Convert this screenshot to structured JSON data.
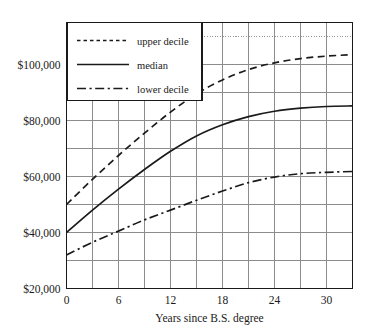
{
  "chart_data": {
    "type": "line",
    "title": "",
    "subtitle": "",
    "xlabel": "Years since B.S. degree",
    "ylabel": "",
    "xlim": [
      0,
      33
    ],
    "ylim": [
      20000,
      115000
    ],
    "grid": true,
    "grid_x_step": 3,
    "grid_y_step": 10000,
    "legend_position": "top-left",
    "x_ticks": [
      0,
      6,
      12,
      18,
      24,
      30
    ],
    "x_tick_labels": [
      "0",
      "6",
      "12",
      "18",
      "24",
      "30"
    ],
    "y_ticks": [
      20000,
      40000,
      60000,
      80000,
      100000
    ],
    "y_tick_labels": [
      "$20,000",
      "$40,000",
      "$60,000",
      "$80,000",
      "$100,000"
    ],
    "x": [
      0,
      3,
      6,
      9,
      12,
      15,
      18,
      21,
      24,
      27,
      30,
      33
    ],
    "series": [
      {
        "name": "upper decile",
        "style": "dashed",
        "color": "#1a1a1a",
        "values": [
          50000,
          59000,
          67500,
          75500,
          83000,
          89500,
          94500,
          98200,
          100600,
          102100,
          103000,
          103500
        ]
      },
      {
        "name": "median",
        "style": "solid",
        "color": "#1a1a1a",
        "values": [
          40000,
          48000,
          55500,
          62500,
          69000,
          74500,
          78500,
          81400,
          83300,
          84400,
          85000,
          85200
        ]
      },
      {
        "name": "lower decile",
        "style": "dash-dot",
        "color": "#1a1a1a",
        "values": [
          32000,
          36500,
          40500,
          44500,
          48000,
          51500,
          54800,
          57800,
          59800,
          61000,
          61500,
          61800
        ]
      }
    ],
    "annotations": [
      {
        "name": "top-dotted-gridline",
        "type": "hline",
        "y": 110000,
        "style": "dotted"
      }
    ]
  },
  "legend": {
    "items": [
      {
        "label": "upper decile",
        "key": "legend-item-upper-decile"
      },
      {
        "label": "median",
        "key": "legend-item-median"
      },
      {
        "label": "lower decile",
        "key": "legend-item-lower-decile"
      }
    ]
  },
  "colors": {
    "grid": "#8c8c8c",
    "axis": "#1a1a1a",
    "curve": "#1a1a1a",
    "background": "#ffffff"
  }
}
